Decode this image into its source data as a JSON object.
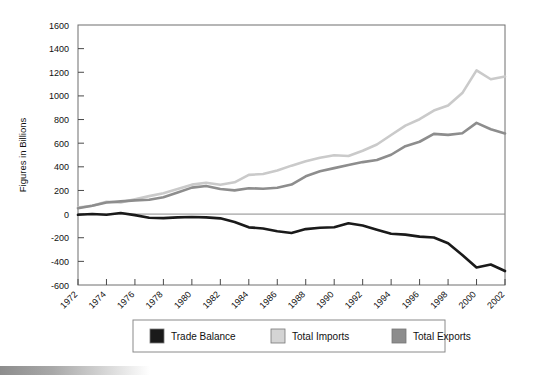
{
  "chart_data": {
    "type": "line",
    "title": "",
    "xlabel": "",
    "ylabel": "Figures in Billions",
    "ylim": [
      -600,
      1600
    ],
    "ytick_labels": [
      "1600",
      "1400",
      "1200",
      "1000",
      "800",
      "600",
      "400",
      "200",
      "0",
      "-200",
      "-400",
      "-600"
    ],
    "yticks": [
      1600,
      1400,
      1200,
      1000,
      800,
      600,
      400,
      200,
      0,
      -200,
      -400,
      -600
    ],
    "xlim": [
      1972,
      2002
    ],
    "xtick_labels": [
      "1972",
      "1974",
      "1976",
      "1978",
      "1980",
      "1982",
      "1984",
      "1986",
      "1988",
      "1990",
      "1992",
      "1994",
      "1996",
      "1998",
      "2000",
      "2002"
    ],
    "xticks": [
      1972,
      1974,
      1976,
      1978,
      1980,
      1982,
      1984,
      1986,
      1988,
      1990,
      1992,
      1994,
      1996,
      1998,
      2000,
      2002
    ],
    "grid": false,
    "legend_position": "bottom",
    "x": [
      1972,
      1973,
      1974,
      1975,
      1976,
      1977,
      1978,
      1979,
      1980,
      1981,
      1982,
      1983,
      1984,
      1985,
      1986,
      1987,
      1988,
      1989,
      1990,
      1991,
      1992,
      1993,
      1994,
      1995,
      1996,
      1997,
      1998,
      1999,
      2000,
      2001,
      2002
    ],
    "series": [
      {
        "name": "Trade Balance",
        "color": "#1a1a1a",
        "values": [
          -6,
          1,
          -5,
          9,
          -9,
          -31,
          -34,
          -28,
          -25,
          -28,
          -36,
          -67,
          -112,
          -122,
          -145,
          -160,
          -127,
          -115,
          -111,
          -77,
          -97,
          -132,
          -166,
          -174,
          -191,
          -198,
          -247,
          -346,
          -452,
          -427,
          -482
        ]
      },
      {
        "name": "Total Imports",
        "color": "#cacaca",
        "values": [
          56,
          71,
          104,
          99,
          125,
          152,
          176,
          212,
          249,
          265,
          248,
          269,
          332,
          339,
          368,
          410,
          447,
          477,
          498,
          491,
          536,
          589,
          669,
          749,
          803,
          876,
          918,
          1024,
          1216,
          1141,
          1164
        ]
      },
      {
        "name": "Total Exports",
        "color": "#8d8d8d",
        "values": [
          49,
          71,
          98,
          108,
          116,
          121,
          143,
          182,
          224,
          237,
          212,
          201,
          219,
          215,
          223,
          250,
          320,
          362,
          389,
          416,
          440,
          457,
          502,
          575,
          612,
          679,
          670,
          684,
          772,
          718,
          682
        ]
      }
    ]
  },
  "legend": {
    "items": [
      {
        "label": "Trade Balance",
        "color": "#1a1a1a"
      },
      {
        "label": "Total Imports",
        "color": "#d4d4d4"
      },
      {
        "label": "Total Exports",
        "color": "#8d8d8d"
      }
    ]
  }
}
